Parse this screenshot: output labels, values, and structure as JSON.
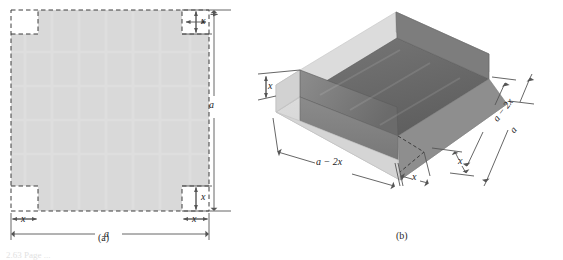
{
  "figure": {
    "panels": [
      {
        "id": "panel-a",
        "caption": "(a)",
        "description": "flat square sheet with square corners cut out",
        "labels": {
          "corner_top_right_x": "x",
          "corner_bottom_right_x": "x",
          "bottom_left_x": "x",
          "bottom_right_x": "x",
          "side_a": "a",
          "bottom_a": "a"
        }
      },
      {
        "id": "panel-b",
        "caption": "(b)",
        "description": "open box formed by folding up the flaps",
        "labels": {
          "height_x": "x",
          "front_width": "a − 2x",
          "front_flap_x": "x",
          "right_inner": "a − 2x",
          "right_outer": "a",
          "right_flap_x": "x"
        }
      }
    ],
    "colors": {
      "sheet_fill": "#d9d9d9",
      "box_base": "#d4d4d4",
      "box_wall_light": "#c9c9c9",
      "box_wall_mid": "#9a9a9a",
      "box_interior_dark": "#6d6d6d",
      "box_interior_darker": "#5d5d5d",
      "outline": "#8a8a8a",
      "dimension_line": "#555555",
      "dashed": "#3a3a3a",
      "background": "#ffffff"
    },
    "footnote_fragment": "2.63  Page  ..."
  }
}
